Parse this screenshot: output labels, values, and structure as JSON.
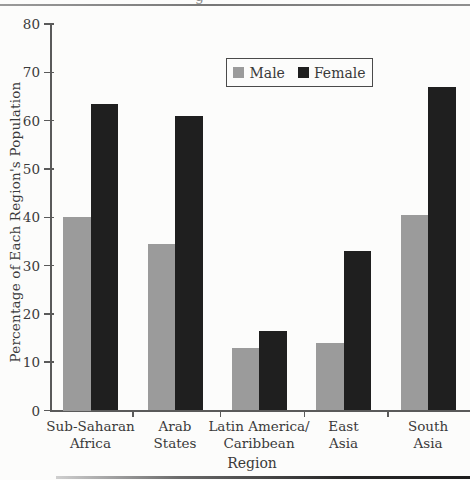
{
  "page": {
    "cropped_text_fragment": "g"
  },
  "colors": {
    "male": "#9b9b9b",
    "female": "#1f1f1f",
    "axis": "#5a5a5a",
    "text": "#3a3a3a",
    "background": "#fcfcfb"
  },
  "chart_data": {
    "type": "bar",
    "title": "",
    "categories": [
      "Sub-Saharan Africa",
      "Arab States",
      "Latin America/ Caribbean",
      "East Asia",
      "South Asia"
    ],
    "category_lines": [
      [
        "Sub-Saharan",
        "Africa"
      ],
      [
        "Arab",
        "States"
      ],
      [
        "Latin America/",
        "Caribbean"
      ],
      [
        "East",
        "Asia"
      ],
      [
        "South",
        "Asia"
      ]
    ],
    "series": [
      {
        "name": "Male",
        "color": "#9b9b9b",
        "values": [
          40,
          34.5,
          13,
          14,
          40.5
        ]
      },
      {
        "name": "Female",
        "color": "#1f1f1f",
        "values": [
          63.5,
          61,
          16.5,
          33,
          67
        ]
      }
    ],
    "xlabel": "Region",
    "ylabel": "Percentage of Each Region's Population",
    "ylim": [
      0,
      80
    ],
    "yticks": [
      0,
      10,
      20,
      30,
      40,
      50,
      60,
      70,
      80
    ],
    "grid": false,
    "legend_position": "top-center"
  }
}
